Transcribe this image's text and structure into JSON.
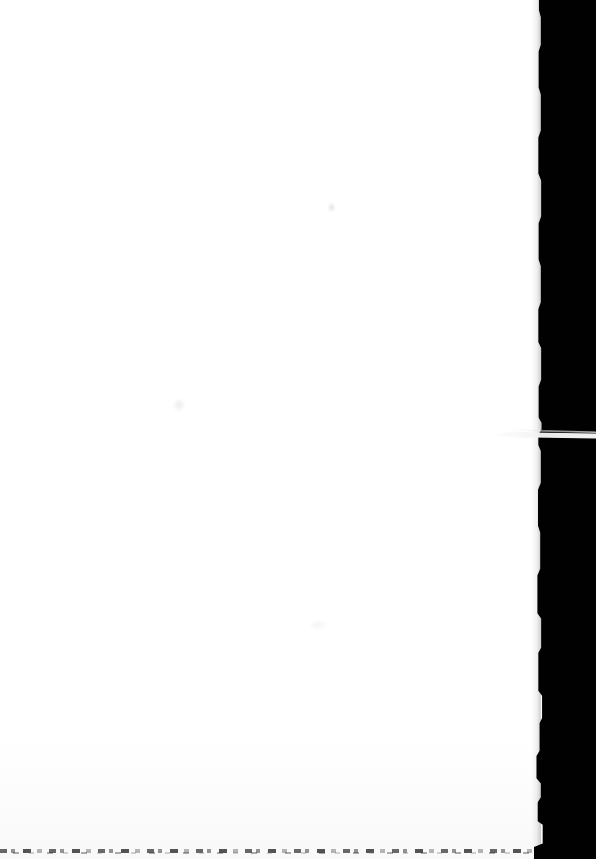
{
  "document": {
    "kind": "scanned-page",
    "page_label": "blank page",
    "orientation": "portrait",
    "width_px": 596,
    "height_px": 859,
    "visible_text": "",
    "text_content_note": "no legible text present on page"
  },
  "canvas": {
    "background_color": "#ffffff",
    "page_color": "#ffffff",
    "scanner_background_color": "#010101"
  },
  "regions": {
    "page_sheet": {
      "name": "page sheet",
      "left_px": 0,
      "top_px": 0,
      "width_px": 545,
      "height_px": 859,
      "color": "#ffffff"
    },
    "scanner_void": {
      "name": "scanner background band",
      "edge_x_px": 537,
      "width_px": 59,
      "height_px": 859,
      "color": "#010101",
      "edge_description": "irregular jagged vertical boundary"
    },
    "paper_sliver": {
      "name": "paper edge sliver",
      "left_px": 497,
      "top_px": 428,
      "width_px": 99,
      "height_px": 12,
      "color": "#f4f5f6",
      "description": "thin tapering pale wedge extending right across the dark band"
    },
    "bottom_edge_speckle": {
      "name": "bottom scan edge",
      "top_px": 848,
      "height_px": 4,
      "width_px": 545,
      "color": "#2a2a2c",
      "description": "broken speckled dark line along the bottom margin"
    }
  },
  "artifacts": [
    {
      "name": "smudge-upper",
      "x_px": 332,
      "y_px": 207,
      "color": "#cdced2"
    },
    {
      "name": "smudge-lower",
      "x_px": 179,
      "y_px": 405,
      "color": "#d4d5d9"
    },
    {
      "name": "smudge-mid-right",
      "x_px": 318,
      "y_px": 625,
      "color": "#e4e5e8"
    }
  ]
}
